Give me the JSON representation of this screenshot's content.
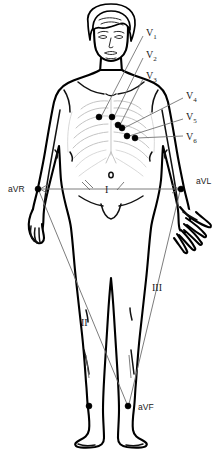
{
  "diagram": {
    "colors": {
      "outline": "#000000",
      "rib": "#b9b9b9",
      "lead_line": "#6d6d6d",
      "electrode": "#000000",
      "background": "#ffffff"
    }
  },
  "precordial_leads": [
    {
      "label": "V",
      "sub": "1",
      "label_x": 146,
      "label_y": 33,
      "electrode_x": 99,
      "electrode_y": 117,
      "line_x1": 143,
      "line_y1": 36,
      "line_x2": 101,
      "line_y2": 117
    },
    {
      "label": "V",
      "sub": "2",
      "label_x": 146,
      "label_y": 55,
      "electrode_x": 112,
      "electrode_y": 117,
      "line_x1": 143,
      "line_y1": 58,
      "line_x2": 114,
      "line_y2": 117
    },
    {
      "label": "V",
      "sub": "3",
      "label_x": 146,
      "label_y": 76,
      "electrode_x": 118,
      "electrode_y": 125,
      "line_x1": 143,
      "line_y1": 79,
      "line_x2": 120,
      "line_y2": 125
    },
    {
      "label": "V",
      "sub": "4",
      "label_x": 186,
      "label_y": 96,
      "electrode_x": 122,
      "electrode_y": 128,
      "line_x1": 183,
      "line_y1": 98,
      "line_x2": 124,
      "line_y2": 128
    },
    {
      "label": "V",
      "sub": "5",
      "label_x": 186,
      "label_y": 117,
      "electrode_x": 127,
      "electrode_y": 136,
      "line_x1": 183,
      "line_y1": 119,
      "line_x2": 129,
      "line_y2": 136
    },
    {
      "label": "V",
      "sub": "6",
      "label_x": 186,
      "label_y": 137,
      "electrode_x": 135,
      "electrode_y": 138,
      "line_x1": 183,
      "line_y1": 136,
      "line_x2": 137,
      "line_y2": 138
    }
  ],
  "limb_leads": [
    {
      "name": "aVR",
      "label": "aVR",
      "label_x": 8,
      "label_y": 190,
      "electrode_x": 38,
      "electrode_y": 189,
      "site": "right wrist"
    },
    {
      "name": "aVL",
      "label": "aVL",
      "label_x": 196,
      "label_y": 182,
      "electrode_x": 181,
      "electrode_y": 189,
      "site": "left wrist"
    },
    {
      "name": "aVF",
      "label": "aVF",
      "label_x": 138,
      "label_y": 409,
      "electrode_x": 128,
      "electrode_y": 406,
      "site": "left ankle"
    }
  ],
  "extra_electrodes": [
    {
      "x": 89,
      "y": 406,
      "site": "right ankle"
    }
  ],
  "bipolar_leads": [
    {
      "label": "I",
      "label_x": 107,
      "label_y": 190,
      "from": "aVR",
      "to": "aVL",
      "x1": 40,
      "y1": 189,
      "x2": 179,
      "y2": 189
    },
    {
      "label": "II",
      "label_x": 85,
      "label_y": 323,
      "from": "aVR",
      "to": "aVF",
      "x1": 39,
      "y1": 191,
      "x2": 127,
      "y2": 404
    },
    {
      "label": "III",
      "label_x": 155,
      "label_y": 288,
      "from": "aVL",
      "to": "aVF",
      "x1": 180,
      "y1": 191,
      "x2": 129,
      "y2": 404
    }
  ]
}
